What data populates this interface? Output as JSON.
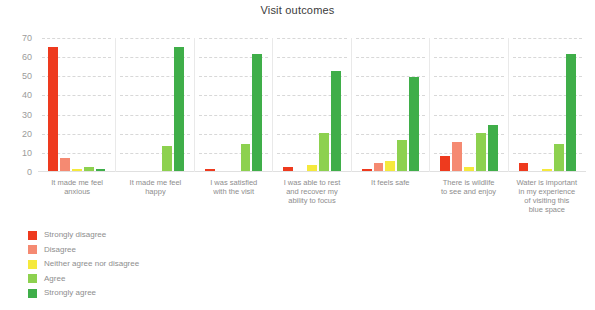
{
  "chart_data": {
    "type": "bar",
    "title": "Visit outcomes",
    "xlabel": "",
    "ylabel": "",
    "ylim": [
      0,
      70
    ],
    "yticks": [
      0,
      10,
      20,
      30,
      40,
      50,
      60,
      70
    ],
    "grid": true,
    "legend_position": "bottom-left",
    "categories": [
      "It made me feel anxious",
      "It made me feel happy",
      "I was satisfied with the visit",
      "I was able to rest and recover my ability to focus",
      "It feels safe",
      "There is wildlife to see and enjoy",
      "Water is important in my experience of visiting this blue space"
    ],
    "category_lines": [
      [
        "It made me feel",
        "anxious"
      ],
      [
        "It made me feel",
        "happy"
      ],
      [
        "I was satisfied",
        "with the visit"
      ],
      [
        "I was able to rest",
        "and recover my",
        "ability to focus"
      ],
      [
        "It feels safe"
      ],
      [
        "There is wildlife",
        "to see and enjoy"
      ],
      [
        "Water is important",
        "in my experience",
        "of visiting this",
        "blue space"
      ]
    ],
    "series": [
      {
        "name": "Strongly disagree",
        "color": "#ee3a1e",
        "values": [
          65,
          0,
          1,
          2,
          1,
          8,
          4
        ]
      },
      {
        "name": "Disagree",
        "color": "#f58a72",
        "values": [
          7,
          0,
          0,
          0,
          4,
          15,
          0
        ]
      },
      {
        "name": "Neither agree nor disagree",
        "color": "#f5e93c",
        "values": [
          1,
          0,
          0,
          3,
          5,
          2,
          1
        ]
      },
      {
        "name": "Agree",
        "color": "#8dd14f",
        "values": [
          2,
          13,
          14,
          20,
          16,
          20,
          14
        ]
      },
      {
        "name": "Strongly agree",
        "color": "#3fae49",
        "values": [
          1,
          65,
          61,
          52,
          49,
          24,
          61
        ]
      }
    ]
  }
}
